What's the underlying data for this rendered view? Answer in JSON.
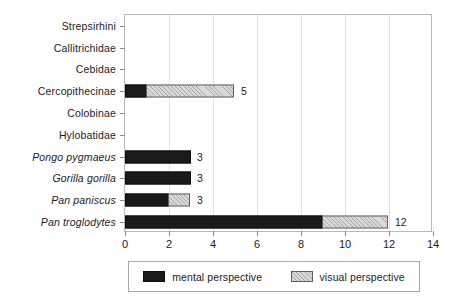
{
  "chart_data": {
    "type": "bar",
    "orientation": "horizontal",
    "stacked": true,
    "title": "",
    "xlabel": "",
    "ylabel": "",
    "xlim": [
      0,
      14
    ],
    "xticks": [
      0,
      2,
      4,
      6,
      8,
      10,
      12,
      14
    ],
    "grid": "vertical",
    "legend_position": "bottom",
    "categories": [
      "Strepsirhini",
      "Callitrichidae",
      "Cebidae",
      "Cercopithecinae",
      "Colobinae",
      "Hylobatidae",
      "Pongo pygmaeus",
      "Gorilla gorilla",
      "Pan paniscus",
      "Pan troglodytes"
    ],
    "category_styles": [
      "normal",
      "normal",
      "normal",
      "normal",
      "normal",
      "normal",
      "italic",
      "italic",
      "italic",
      "italic"
    ],
    "series": [
      {
        "name": "mental perspective",
        "color": "#1a1a1a",
        "fill": "solid",
        "values": [
          0,
          0,
          0,
          1,
          0,
          0,
          3,
          3,
          2,
          9
        ]
      },
      {
        "name": "visual perspective",
        "color": "#d9d9d9",
        "fill": "hatched",
        "values": [
          0,
          0,
          0,
          4,
          0,
          0,
          0,
          0,
          1,
          3
        ]
      }
    ],
    "totals": [
      0,
      0,
      0,
      5,
      0,
      0,
      3,
      3,
      3,
      12
    ],
    "total_labels": [
      "",
      "",
      "",
      "5",
      "",
      "",
      "3",
      "3",
      "3",
      "12"
    ]
  },
  "legend": {
    "entries": [
      {
        "label": "mental perspective",
        "swatch": "solid-black-swatch"
      },
      {
        "label": "visual perspective",
        "swatch": "hatched-gray-swatch"
      }
    ]
  },
  "axis": {
    "x_tick_labels": [
      "0",
      "2",
      "4",
      "6",
      "8",
      "10",
      "12",
      "14"
    ]
  }
}
